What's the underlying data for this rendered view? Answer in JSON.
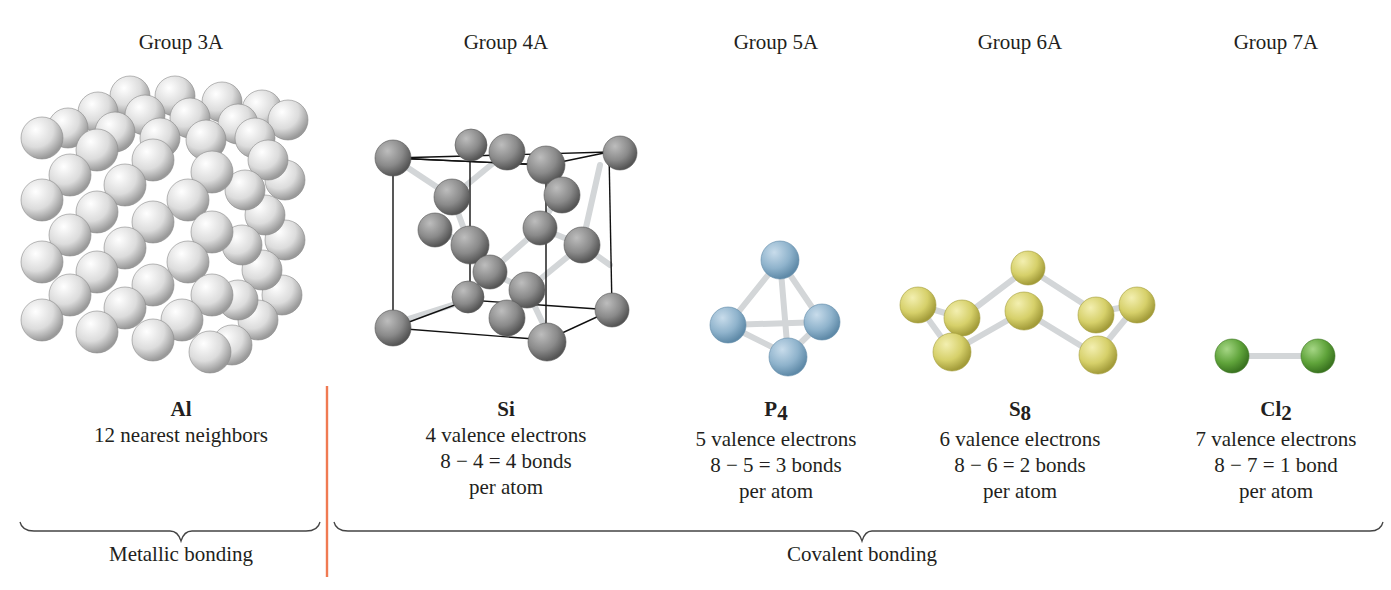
{
  "groups": [
    {
      "label": "Group 3A",
      "x": 181
    },
    {
      "label": "Group 4A",
      "x": 506
    },
    {
      "label": "Group 5A",
      "x": 776
    },
    {
      "label": "Group 6A",
      "x": 1020
    },
    {
      "label": "Group 7A",
      "x": 1276
    }
  ],
  "molecules": [
    {
      "formula": "Al",
      "sub": "",
      "lines": [
        "12 nearest neighbors",
        "",
        ""
      ],
      "x": 181
    },
    {
      "formula": "Si",
      "sub": "",
      "lines": [
        "4 valence electrons",
        "8 − 4 = 4 bonds",
        "per atom"
      ],
      "x": 506
    },
    {
      "formula": "P",
      "sub": "4",
      "lines": [
        "5 valence electrons",
        "8 − 5 = 3 bonds",
        "per atom"
      ],
      "x": 776
    },
    {
      "formula": "S",
      "sub": "8",
      "lines": [
        "6 valence electrons",
        "8 − 6 = 2 bonds",
        "per atom"
      ],
      "x": 1020
    },
    {
      "formula": "Cl",
      "sub": "2",
      "lines": [
        "7 valence electrons",
        "8 − 7 = 1 bond",
        "per atom"
      ],
      "x": 1276
    }
  ],
  "bonding": {
    "metallic": "Metallic bonding",
    "covalent": "Covalent bonding"
  },
  "colors": {
    "aluminum": "#e8e8e8",
    "silicon": "#8a8a8a",
    "phosphorus": "#8fb3cc",
    "sulfur": "#d6d06a",
    "chlorine": "#5fa33a",
    "bond": "#d9dde0",
    "separator": "#f07a52",
    "text": "#231f20"
  }
}
